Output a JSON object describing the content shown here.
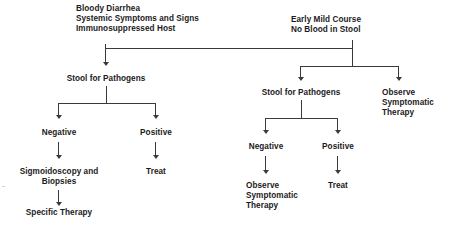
{
  "diagram": {
    "type": "clinical-decision-flowchart",
    "background_color": "#ffffff",
    "line_color": "#3a3a3a",
    "text_color": "#1b1b1b"
  },
  "nodes": {
    "left_entry": "Bloody Diarrhea\nSystemic Symptoms and Signs\nImmunosuppressed Host",
    "right_entry": "Early Mild Course\nNo Blood in Stool",
    "left_stool": "Stool for Pathogens",
    "left_negative": "Negative",
    "left_positive": "Positive",
    "left_sigmoidoscopy": "Sigmoidoscopy and\nBiopsies",
    "left_specific_therapy": "Specific Therapy",
    "left_treat": "Treat",
    "right_stool": "Stool for Pathogens",
    "right_observe_top": "Observe\nSymptomatic\nTherapy",
    "right_negative": "Negative",
    "right_positive": "Positive",
    "right_observe_bottom": "Observe\nSymptomatic\nTherapy",
    "right_treat": "Treat"
  },
  "edges": [
    {
      "from": "left_entry",
      "to": "left_stool"
    },
    {
      "from": "right_entry",
      "to": "left_stool"
    },
    {
      "from": "right_entry",
      "to": "right_stool"
    },
    {
      "from": "right_entry",
      "to": "right_observe_top"
    },
    {
      "from": "left_stool",
      "to": "left_negative"
    },
    {
      "from": "left_stool",
      "to": "left_positive"
    },
    {
      "from": "left_negative",
      "to": "left_sigmoidoscopy"
    },
    {
      "from": "left_sigmoidoscopy",
      "to": "left_specific_therapy"
    },
    {
      "from": "left_positive",
      "to": "left_treat"
    },
    {
      "from": "right_stool",
      "to": "right_negative"
    },
    {
      "from": "right_stool",
      "to": "right_positive"
    },
    {
      "from": "right_negative",
      "to": "right_observe_bottom"
    },
    {
      "from": "right_positive",
      "to": "right_treat"
    }
  ]
}
